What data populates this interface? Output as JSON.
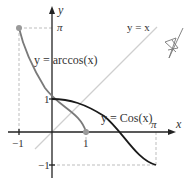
{
  "diagram": {
    "axes": {
      "x_label": "x",
      "y_label": "y",
      "x_ticks": [
        "−1",
        "1",
        "π"
      ],
      "y_ticks": [
        "π",
        "1",
        "−1"
      ]
    },
    "curves": [
      {
        "name": "y = Cos(x)",
        "label": "y = Cos(x)",
        "domain": "[0, π]",
        "color": "#1a1a1a"
      },
      {
        "name": "y = arccos(x)",
        "label": "y = arccos(x)",
        "domain": "[−1, 1]",
        "color": "#7a7a7a"
      },
      {
        "name": "y = x",
        "label": "y = x",
        "color": "#c8c8c8"
      }
    ],
    "points": [
      {
        "label": "(−1, π)",
        "color": "#9a9a9a"
      },
      {
        "label": "(1, 0)",
        "color": "#9a9a9a"
      }
    ],
    "labels": {
      "arccos": "y = arccos(x)",
      "cos": "y = Cos(x)",
      "identity": "y = x",
      "x_axis": "x",
      "y_axis": "y",
      "pi_x": "π",
      "pi_y": "π",
      "one_x": "1",
      "one_y": "1",
      "neg_one_x": "−1",
      "neg_one_y": "−1"
    }
  }
}
